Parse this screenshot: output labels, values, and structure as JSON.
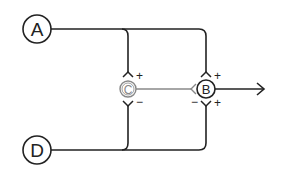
{
  "diagram": {
    "colors": {
      "primary": "#222222",
      "muted": "#888888",
      "background": "#ffffff"
    },
    "nodes": [
      {
        "id": "A",
        "label": "A"
      },
      {
        "id": "B",
        "label": "B"
      },
      {
        "id": "C",
        "label": "C"
      },
      {
        "id": "D",
        "label": "D"
      }
    ],
    "signs": {
      "c_top": "+",
      "c_bottom": "−",
      "b_top": "+",
      "b_left_bottom": "−",
      "b_right_bottom": "+"
    },
    "edges": [
      {
        "from": "A",
        "to": "C",
        "sign": "+"
      },
      {
        "from": "A",
        "to": "B",
        "sign": "+"
      },
      {
        "from": "D",
        "to": "C",
        "sign": "−"
      },
      {
        "from": "D",
        "to": "B",
        "sign": "+"
      },
      {
        "from": "C",
        "to": "B",
        "sign": "−"
      },
      {
        "from": "B",
        "to": "output",
        "sign": ""
      }
    ]
  }
}
